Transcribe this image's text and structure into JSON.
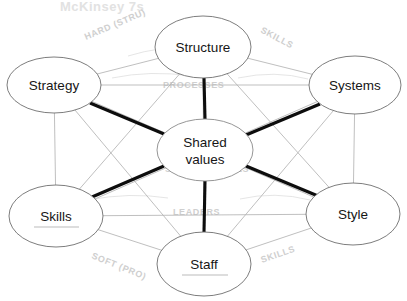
{
  "diagram": {
    "framework_title": "McKinsey 7S",
    "center": {
      "id": "shared-values",
      "label_line1": "Shared",
      "label_line2": "values",
      "cx": 205,
      "cy": 150,
      "rx": 48,
      "ry": 31
    },
    "nodes": [
      {
        "id": "structure",
        "label": "Structure",
        "cx": 203,
        "cy": 47,
        "rx": 48,
        "ry": 31
      },
      {
        "id": "systems",
        "label": "Systems",
        "cx": 355,
        "cy": 85,
        "rx": 46,
        "ry": 29
      },
      {
        "id": "style",
        "label": "Style",
        "cx": 353,
        "cy": 214,
        "rx": 47,
        "ry": 31
      },
      {
        "id": "staff",
        "label": "Staff",
        "cx": 204,
        "cy": 264,
        "rx": 47,
        "ry": 32
      },
      {
        "id": "skills",
        "label": "Skills",
        "cx": 56,
        "cy": 216,
        "rx": 47,
        "ry": 31
      },
      {
        "id": "strategy",
        "label": "Strategy",
        "cx": 54,
        "cy": 85,
        "rx": 47,
        "ry": 28
      }
    ],
    "spokes": [
      {
        "from": "shared-values",
        "to": "structure",
        "weight": "thick"
      },
      {
        "from": "shared-values",
        "to": "systems",
        "weight": "thick"
      },
      {
        "from": "shared-values",
        "to": "style",
        "weight": "thick"
      },
      {
        "from": "shared-values",
        "to": "staff",
        "weight": "thick"
      },
      {
        "from": "shared-values",
        "to": "skills",
        "weight": "thick"
      },
      {
        "from": "shared-values",
        "to": "strategy",
        "weight": "thick"
      }
    ],
    "perimeter_edges": [
      {
        "from": "strategy",
        "to": "structure"
      },
      {
        "from": "structure",
        "to": "systems"
      },
      {
        "from": "systems",
        "to": "style"
      },
      {
        "from": "style",
        "to": "staff"
      },
      {
        "from": "staff",
        "to": "skills"
      },
      {
        "from": "skills",
        "to": "strategy"
      },
      {
        "from": "strategy",
        "to": "systems"
      },
      {
        "from": "skills",
        "to": "style"
      },
      {
        "from": "structure",
        "to": "staff"
      },
      {
        "from": "strategy",
        "to": "staff"
      },
      {
        "from": "structure",
        "to": "style"
      },
      {
        "from": "systems",
        "to": "staff"
      },
      {
        "from": "structure",
        "to": "skills"
      },
      {
        "from": "strategy",
        "to": "style"
      },
      {
        "from": "systems",
        "to": "skills"
      }
    ]
  },
  "annotations": {
    "title": "McKinsey 7s",
    "top_left": "HARD (STRU)",
    "top_right": "SKILLS",
    "upper_mid": "PROCESSES",
    "center_under": "SHARED VALUES",
    "lower_mid": "LEADERS",
    "bottom_left": "SOFT (PRO)",
    "bottom_right": "SKILLS"
  },
  "colors": {
    "node_stroke": "#6e6e6e",
    "thin_edge": "#b4b4b4",
    "thick_edge": "#0d0d0d",
    "annotation": "#cfcfcf",
    "label_text": "#161616",
    "background": "#ffffff"
  }
}
